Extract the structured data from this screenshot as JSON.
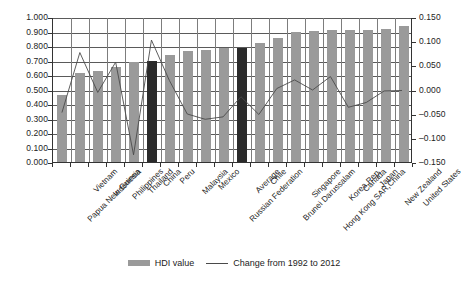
{
  "chart_data": {
    "type": "bar",
    "title": "",
    "subtitle": "",
    "xlabel": "",
    "ylabel": "",
    "categories": [
      "Papua New Guinea",
      "Vietnam",
      "Indonesia",
      "Philippines",
      "Thailand",
      "China",
      "Peru",
      "Malaysia",
      "Mexico",
      "Russian Federation",
      "Average",
      "Chile",
      "Brunei Darussalam",
      "Singapore",
      "Hong Kong SAR,China",
      "Korea,Rep.",
      "Canada",
      "Japan",
      "New Zealand",
      "United States"
    ],
    "highlighted_categories": [
      "China",
      "Average"
    ],
    "series": [
      {
        "name": "HDI value",
        "type": "bar",
        "axis": "left",
        "color": "#9a9a9a",
        "highlight_color": "#2b2b2b",
        "values": [
          0.461,
          0.611,
          0.629,
          0.654,
          0.69,
          0.699,
          0.741,
          0.769,
          0.775,
          0.788,
          0.789,
          0.819,
          0.855,
          0.895,
          0.906,
          0.909,
          0.911,
          0.912,
          0.919,
          0.937
        ]
      },
      {
        "name": "Change from 1992 to 2012",
        "type": "line",
        "axis": "right",
        "color": "#4a4a4a",
        "values": [
          -0.047,
          0.078,
          -0.005,
          0.058,
          -0.135,
          0.104,
          0.02,
          -0.05,
          -0.061,
          -0.056,
          -0.014,
          -0.051,
          0.003,
          0.021,
          0.0,
          0.028,
          -0.036,
          -0.026,
          -0.002,
          -0.001
        ]
      }
    ],
    "left_axis": {
      "ticks": [
        "0.000",
        "0.100",
        "0.200",
        "0.300",
        "0.400",
        "0.500",
        "0.600",
        "0.700",
        "0.800",
        "0.900",
        "1.000"
      ],
      "min": 0.0,
      "max": 1.0,
      "step": 0.1
    },
    "right_axis": {
      "ticks": [
        "-0.150",
        "-0.100",
        "-0.050",
        "0.000",
        "0.050",
        "0.100",
        "0.150"
      ],
      "min": -0.15,
      "max": 0.15,
      "step": 0.05
    },
    "grid": true,
    "legend_position": "bottom",
    "legend": [
      {
        "label": "HDI value",
        "marker": "bar",
        "color": "#9a9a9a"
      },
      {
        "label": "Change from 1992 to 2012",
        "marker": "line",
        "color": "#4a4a4a"
      }
    ]
  }
}
